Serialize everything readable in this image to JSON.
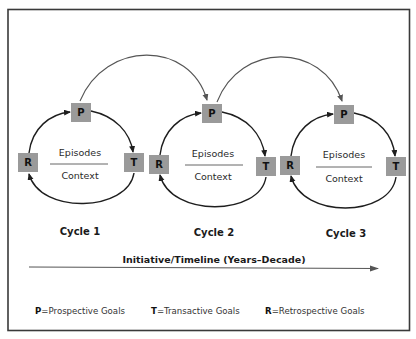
{
  "diagram": {
    "cycles": [
      {
        "title": "Cycle 1",
        "nodes": {
          "R": "R",
          "P": "P",
          "T": "T"
        },
        "top_text": "Episodes",
        "bottom_text": "Context"
      },
      {
        "title": "Cycle 2",
        "nodes": {
          "R": "R",
          "P": "P",
          "T": "T"
        },
        "top_text": "Episodes",
        "bottom_text": "Context"
      },
      {
        "title": "Cycle 3",
        "nodes": {
          "R": "R",
          "P": "P",
          "T": "T"
        },
        "top_text": "Episodes",
        "bottom_text": "Context"
      }
    ],
    "connections": [
      {
        "from": "Cycle 1 P",
        "to": "Cycle 2 P"
      },
      {
        "from": "Cycle 2 P",
        "to": "Cycle 3 P"
      }
    ],
    "timeline": {
      "label": "Initiative/Timeline (Years–Decade)"
    },
    "legend": [
      {
        "key": "P",
        "text": "=Prospective Goals"
      },
      {
        "key": "T",
        "text": "=Transactive Goals"
      },
      {
        "key": "R",
        "text": "=Retrospective Goals"
      }
    ],
    "colors": {
      "node_fill": "#9a9a9a",
      "frame": "#3a3a3a",
      "arrow": "#1e1e1e"
    }
  }
}
